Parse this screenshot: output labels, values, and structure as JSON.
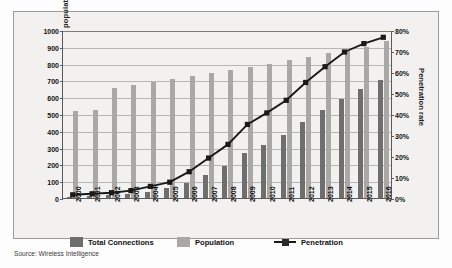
{
  "source_note": "Source: Wireless Intelligence",
  "legend": {
    "items": [
      {
        "key": "total_connections",
        "label": "Total Connections",
        "marker": "swatch-dark",
        "color": "#6e6e6e"
      },
      {
        "key": "population",
        "label": "Population",
        "marker": "swatch-light",
        "color": "#a9a8a5"
      },
      {
        "key": "penetration",
        "label": "Penetration",
        "marker": "line-with-square",
        "color": "#1a1a1a"
      }
    ]
  },
  "chart_data": {
    "type": "bar",
    "title": "",
    "subtitle": "",
    "xlabel": "",
    "ylabel": "Million connections and population",
    "y2label": "Penetration rate",
    "grid": true,
    "legend_position": "bottom",
    "ylim": [
      0,
      1000
    ],
    "ytick_step": 100,
    "y2lim": [
      0,
      80
    ],
    "y2tick_step": 10,
    "yticks": [
      "0",
      "100",
      "200",
      "300",
      "400",
      "500",
      "600",
      "700",
      "800",
      "900",
      "1000"
    ],
    "y2ticks": [
      "0%",
      "10%",
      "20%",
      "30%",
      "40%",
      "50%",
      "60%",
      "70%",
      "80%"
    ],
    "categories": [
      "2000",
      "2001",
      "2002",
      "2003",
      "2004",
      "2005",
      "2006",
      "2007",
      "2008",
      "2009",
      "2010",
      "2011",
      "2012",
      "2013",
      "2014",
      "2015",
      "2016"
    ],
    "series": [
      {
        "name": "Total Connections",
        "type": "bar",
        "axis": "left",
        "units": "millions",
        "color": "#6e6e6e",
        "values": [
          8,
          12,
          17,
          25,
          38,
          58,
          92,
          137,
          193,
          265,
          313,
          374,
          450,
          525,
          590,
          650,
          700
        ]
      },
      {
        "name": "Population",
        "type": "bar",
        "axis": "left",
        "units": "millions",
        "color": "#a9a8a5",
        "values": [
          515,
          525,
          655,
          670,
          690,
          710,
          725,
          745,
          762,
          780,
          800,
          820,
          840,
          862,
          878,
          900,
          935
        ]
      },
      {
        "name": "Penetration",
        "type": "line",
        "axis": "right",
        "units": "percent",
        "color": "#1a1a1a",
        "values": [
          2,
          2.5,
          3,
          4,
          6,
          8,
          13,
          19.5,
          26,
          35.5,
          41,
          47,
          55.5,
          63,
          70,
          74,
          77
        ]
      }
    ]
  }
}
